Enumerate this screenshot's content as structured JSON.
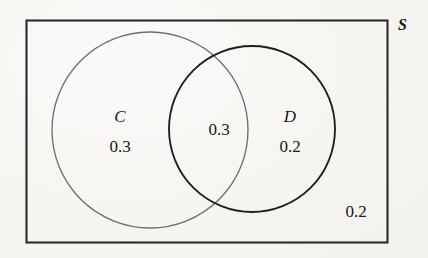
{
  "figure": {
    "kind": "venn-diagram",
    "universe_label": "S",
    "background_color": "#f7f6f3",
    "rect_stroke_color": "#2a2a2a",
    "set_c_stroke_color": "#6f6f6f",
    "set_d_stroke_color": "#1e1e1e",
    "text_color": "#171717"
  },
  "labels": {
    "universe": "S",
    "set_c_name": "C",
    "set_c_value": "0.3",
    "intersection_value": "0.3",
    "set_d_name": "D",
    "set_d_value": "0.2",
    "outside_value": "0.2"
  },
  "chart_data": {
    "type": "venn",
    "title": "",
    "universe": "S",
    "sets": [
      "C",
      "D"
    ],
    "regions": [
      {
        "id": "C-only",
        "label": "C",
        "value": 0.3,
        "display": "0.3",
        "sets": [
          "C"
        ]
      },
      {
        "id": "C-and-D",
        "label": "",
        "value": 0.3,
        "display": "0.3",
        "sets": [
          "C",
          "D"
        ]
      },
      {
        "id": "D-only",
        "label": "D",
        "value": 0.2,
        "display": "0.2",
        "sets": [
          "D"
        ]
      },
      {
        "id": "outside-both",
        "label": "S",
        "value": 0.2,
        "display": "0.2",
        "sets": []
      }
    ],
    "total": 1.0,
    "geometry": {
      "rect": {
        "x": 26,
        "y": 20,
        "width": 362,
        "height": 223
      },
      "circle_c": {
        "cx": 150,
        "cy": 130,
        "r": 98
      },
      "circle_d": {
        "cx": 252,
        "cy": 129,
        "r": 83
      }
    },
    "legend": "none",
    "grid": false
  }
}
